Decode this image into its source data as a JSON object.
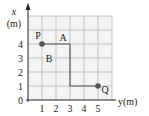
{
  "diagram": {
    "vertical_axis_label": "x",
    "vertical_axis_unit": "(m)",
    "horizontal_axis_label": "y(m)",
    "vertical_ticks": [
      "0",
      "1",
      "2",
      "3",
      "4"
    ],
    "horizontal_ticks": [
      "1",
      "2",
      "3",
      "4",
      "5"
    ],
    "grid_extent_units": 6,
    "region_labels": [
      {
        "text": "A",
        "y_units": 2.5,
        "x_units": 4.5
      },
      {
        "text": "B",
        "y_units": 1.5,
        "x_units": 3.0
      }
    ],
    "points": [
      {
        "name": "P",
        "y_units": 1,
        "x_units": 4
      },
      {
        "name": "Q",
        "y_units": 5,
        "x_units": 1
      }
    ],
    "path_units": [
      [
        1,
        4
      ],
      [
        3,
        4
      ],
      [
        3,
        1
      ],
      [
        5,
        1
      ]
    ],
    "colors": {
      "background": "#f4f4f4",
      "grid": "#b9b9b9",
      "point": "#555555"
    }
  }
}
